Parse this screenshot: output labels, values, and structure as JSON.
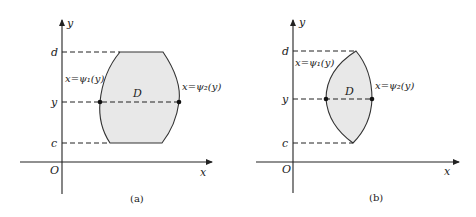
{
  "figure": {
    "panels": [
      {
        "id": "a",
        "caption": "(a)",
        "axis_x_label": "x",
        "axis_y_label": "y",
        "origin_label": "O",
        "tick_d": "d",
        "tick_y": "y",
        "tick_c": "c",
        "region_label": "D",
        "left_curve_label": "x=ψ₁(y)",
        "right_curve_label": "x=ψ₂(y)",
        "shape": "barrel region with flat top and bottom edges"
      },
      {
        "id": "b",
        "caption": "(b)",
        "axis_x_label": "x",
        "axis_y_label": "y",
        "origin_label": "O",
        "tick_d": "d",
        "tick_y": "y",
        "tick_c": "c",
        "region_label": "D",
        "left_curve_label": "x=ψ₁(y)",
        "right_curve_label": "x=ψ₂(y)",
        "shape": "lens region meeting at points on y=c and y=d"
      }
    ],
    "colors": {
      "region_fill": "#e8e8e8",
      "stroke": "#222222"
    }
  }
}
